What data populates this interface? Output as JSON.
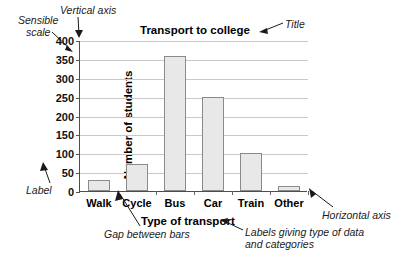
{
  "chart_data": {
    "type": "bar",
    "title": "Transport to college",
    "xlabel": "Type of transport",
    "ylabel": "Number of students",
    "categories": [
      "Walk",
      "Cycle",
      "Bus",
      "Car",
      "Train",
      "Other"
    ],
    "values": [
      28,
      72,
      358,
      250,
      100,
      12
    ],
    "ylim": [
      0,
      400
    ],
    "ytick_step": 50,
    "yticks": [
      0,
      50,
      100,
      150,
      200,
      250,
      300,
      350,
      400
    ],
    "ytick_labels": [
      "0",
      "50",
      "100",
      "150",
      "200",
      "250",
      "300",
      "350",
      "400"
    ],
    "grid": true,
    "legend": false,
    "bar_color": "#e8e8e8",
    "bar_edge_color": "#8a8a8a",
    "grid_color": "#c9c9c9",
    "axis_color": "#4d4d4d"
  },
  "annotations": {
    "sensible_scale": "Sensible\nscale",
    "vertical_axis": "Vertical axis",
    "title_callout": "Title",
    "label": "Label",
    "gap_between_bars": "Gap between bars",
    "horizontal_axis": "Horizontal axis",
    "category_labels": "Labels giving type of data\nand categories"
  }
}
